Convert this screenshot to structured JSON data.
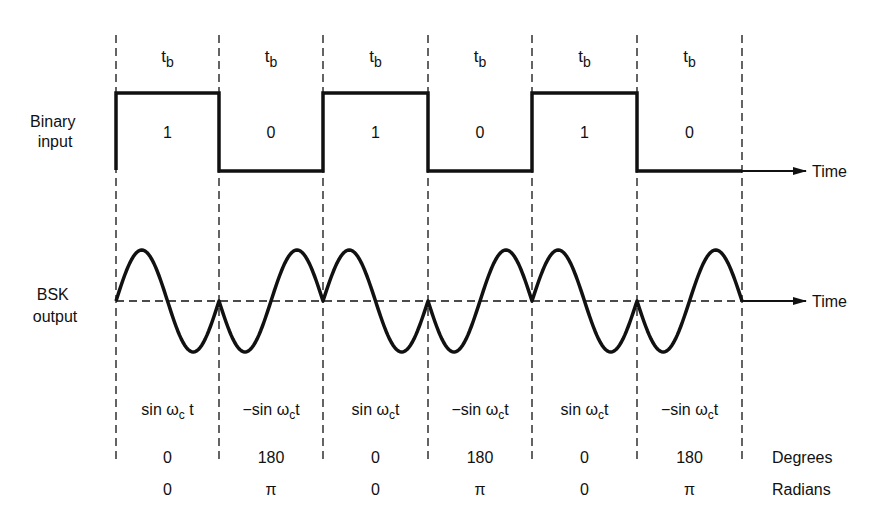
{
  "row_labels": {
    "binary_input": [
      "Binary",
      "input"
    ],
    "bsk_output": [
      "BSK",
      "output"
    ]
  },
  "axis_labels": {
    "time_top": "Time",
    "time_bottom": "Time",
    "degrees": "Degrees",
    "radians": "Radians"
  },
  "period_label": {
    "main": "t",
    "sub": "b"
  },
  "boundaries_x": [
    116,
    219,
    323,
    428,
    532,
    637,
    742
  ],
  "bits": [
    {
      "value": "1",
      "waveform": {
        "sign": "sin ",
        "omega": "ω",
        "sub": "c",
        "t": " t"
      },
      "degrees": "0",
      "radians": "0"
    },
    {
      "value": "0",
      "waveform": {
        "sign": "−sin ",
        "omega": "ω",
        "sub": "c",
        "t": "t"
      },
      "degrees": "180",
      "radians": "π"
    },
    {
      "value": "1",
      "waveform": {
        "sign": "sin ",
        "omega": "ω",
        "sub": "c",
        "t": "t"
      },
      "degrees": "0",
      "radians": "0"
    },
    {
      "value": "0",
      "waveform": {
        "sign": "−sin ",
        "omega": "ω",
        "sub": "c",
        "t": "t"
      },
      "degrees": "180",
      "radians": "π"
    },
    {
      "value": "1",
      "waveform": {
        "sign": "sin ",
        "omega": "ω",
        "sub": "c",
        "t": "t"
      },
      "degrees": "0",
      "radians": "0"
    },
    {
      "value": "0",
      "waveform": {
        "sign": "−sin ",
        "omega": "ω",
        "sub": "c",
        "t": "t"
      },
      "degrees": "180",
      "radians": "π"
    }
  ],
  "colors": {
    "line": "#111111",
    "background": "#ffffff"
  }
}
